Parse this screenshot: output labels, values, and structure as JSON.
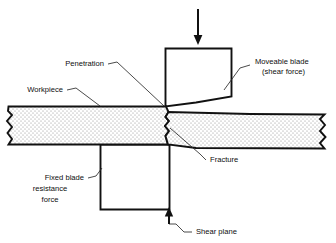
{
  "figure": {
    "type": "technical-diagram",
    "background_color": "#ffffff",
    "line_color": "#111111",
    "fill_pattern": "stipple-dots"
  },
  "labels": {
    "penetration": "Penetration",
    "workpiece": "Workpiece",
    "moveable_blade_line1": "Moveable blade",
    "moveable_blade_line2": "(shear force)",
    "fracture": "Fracture",
    "fixed_blade_line1": "Fixed blade",
    "fixed_blade_line2": "resistance",
    "fixed_blade_line3": "force",
    "shear_plane": "Shear plane"
  },
  "parts": {
    "moveable_blade": "moveable-blade",
    "fixed_blade": "fixed-blade",
    "workpiece_left": "workpiece-left-segment",
    "workpiece_right": "workpiece-right-segment"
  },
  "arrows": {
    "shear_force_direction": "down",
    "shear_plane_direction": "up"
  }
}
